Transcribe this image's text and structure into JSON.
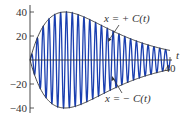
{
  "chart_data": {
    "type": "line",
    "title": "",
    "xlabel": "t",
    "ylabel": "",
    "xlim": [
      0,
      40
    ],
    "ylim": [
      -40,
      40
    ],
    "x_ticks": [
      "40"
    ],
    "y_ticks": [
      "40",
      "20",
      "-20",
      "-40"
    ],
    "grid": false,
    "legend": null,
    "series": [
      {
        "name": "x(t) oscillation",
        "description": "rapid oscillation within envelope, about 24 cycles over 0-40",
        "color": "#1a3fb0"
      },
      {
        "name": "x = + C(t)",
        "description": "upper envelope rising from 0 to peak about 40 near t=10 then decaying toward 0 by t=40",
        "color": "#333333"
      },
      {
        "name": "x = - C(t)",
        "description": "lower envelope, mirror of upper",
        "color": "#333333"
      }
    ],
    "envelope_samples": {
      "t": [
        0,
        2,
        4,
        6,
        8,
        10,
        12,
        15,
        20,
        25,
        30,
        35,
        40
      ],
      "C": [
        0,
        17.8,
        29.1,
        35.8,
        39.1,
        40,
        39.3,
        36.4,
        29.4,
        21.7,
        14.6,
        9.5,
        5.8
      ]
    },
    "annotations": [
      {
        "text": "x = + C(t)",
        "points_to": "upper envelope near t≈22"
      },
      {
        "text": "x = − C(t)",
        "points_to": "lower envelope near t≈23"
      }
    ]
  },
  "labels": {
    "y40": "40",
    "y20": "20",
    "yn20": "−20",
    "yn40": "−40",
    "x40": "40",
    "xaxis": "t",
    "upper": "x = + C(t)",
    "lower": "x = − C(t)"
  }
}
